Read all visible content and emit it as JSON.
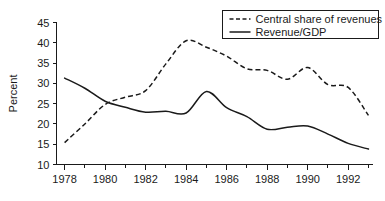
{
  "chart_data": {
    "type": "line",
    "title": "",
    "xlabel": "",
    "ylabel": "Percent",
    "xlim": [
      1977.6,
      1993.2
    ],
    "ylim": [
      10,
      45
    ],
    "grid": false,
    "legend_position": "top-right",
    "xticks": [
      1978,
      1980,
      1982,
      1984,
      1986,
      1988,
      1990,
      1992
    ],
    "xtick_labels": [
      "1978",
      "1980",
      "1982",
      "1984",
      "1986",
      "1988",
      "1990",
      "1992"
    ],
    "xminor_ticks": [
      1979,
      1981,
      1983,
      1985,
      1987,
      1989,
      1991,
      1993
    ],
    "yticks": [
      10,
      15,
      20,
      25,
      30,
      35,
      40,
      45
    ],
    "ytick_labels": [
      "10",
      "15",
      "20",
      "25",
      "30",
      "35",
      "40",
      "45"
    ],
    "x": [
      1978,
      1979,
      1980,
      1981,
      1982,
      1983,
      1984,
      1985,
      1986,
      1987,
      1988,
      1989,
      1990,
      1991,
      1992,
      1993
    ],
    "series": [
      {
        "name": "Central share of revenues",
        "style": "dashed",
        "color": "#1a1a1a",
        "values": [
          15.4,
          20.0,
          24.8,
          26.6,
          28.2,
          34.8,
          40.5,
          38.9,
          36.7,
          33.6,
          33.2,
          31.0,
          33.9,
          29.7,
          29.0,
          22.1
        ]
      },
      {
        "name": "Revenue/GDP",
        "style": "solid",
        "color": "#1a1a1a",
        "values": [
          31.3,
          28.8,
          25.6,
          24.1,
          22.9,
          23.1,
          22.7,
          28.0,
          24.0,
          21.8,
          18.7,
          19.2,
          19.5,
          17.5,
          15.2,
          13.8
        ]
      }
    ]
  },
  "legend": {
    "items": [
      {
        "label": "Central share of revenues",
        "style": "dashed"
      },
      {
        "label": "Revenue/GDP",
        "style": "solid"
      }
    ]
  },
  "axes": {
    "y_title": "Percent"
  }
}
